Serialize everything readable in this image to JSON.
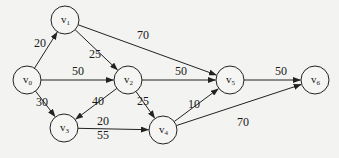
{
  "diagram": {
    "type": "directed-weighted-graph",
    "nodes": [
      {
        "id": "v0",
        "base": "v",
        "sub": "0",
        "x": 27,
        "y": 80
      },
      {
        "id": "v1",
        "base": "v",
        "sub": "1",
        "x": 65,
        "y": 20
      },
      {
        "id": "v2",
        "base": "v",
        "sub": "2",
        "x": 128,
        "y": 80
      },
      {
        "id": "v3",
        "base": "v",
        "sub": "3",
        "x": 64,
        "y": 128
      },
      {
        "id": "v4",
        "base": "v",
        "sub": "4",
        "x": 163,
        "y": 130
      },
      {
        "id": "v5",
        "base": "v",
        "sub": "5",
        "x": 230,
        "y": 80
      },
      {
        "id": "v6",
        "base": "v",
        "sub": "6",
        "x": 315,
        "y": 80
      }
    ],
    "edges": [
      {
        "from": "v0",
        "to": "v1",
        "weight": "20",
        "lx": 34,
        "ly": 47
      },
      {
        "from": "v0",
        "to": "v2",
        "weight": "50",
        "lx": 72,
        "ly": 75
      },
      {
        "from": "v0",
        "to": "v3",
        "weight": "30",
        "lx": 36,
        "ly": 106
      },
      {
        "from": "v1",
        "to": "v2",
        "weight": "25",
        "lx": 89,
        "ly": 58
      },
      {
        "from": "v1",
        "to": "v5",
        "weight": "70",
        "lx": 137,
        "ly": 39
      },
      {
        "from": "v2",
        "to": "v3",
        "weight": "40",
        "lx": 92,
        "ly": 105
      },
      {
        "from": "v2",
        "to": "v4",
        "weight": "25",
        "lx": 137,
        "ly": 105
      },
      {
        "from": "v2",
        "to": "v5",
        "weight": "50",
        "lx": 175,
        "ly": 75
      },
      {
        "from": "v3",
        "to": "v4",
        "weight": "20",
        "lx": 97,
        "ly": 125
      },
      {
        "from": "v3",
        "to": "v4",
        "weight_secondary": "55",
        "lx": 97,
        "ly": 139,
        "label_only": true
      },
      {
        "from": "v4",
        "to": "v5",
        "weight": "10",
        "lx": 188,
        "ly": 108
      },
      {
        "from": "v4",
        "to": "v6",
        "weight": "70",
        "lx": 237,
        "ly": 126
      },
      {
        "from": "v5",
        "to": "v6",
        "weight": "50",
        "lx": 275,
        "ly": 75
      }
    ],
    "node_radius": 14,
    "colors": {
      "background": "#f3f3f1",
      "stroke": "#222222",
      "text": "#1a1a1a"
    }
  }
}
